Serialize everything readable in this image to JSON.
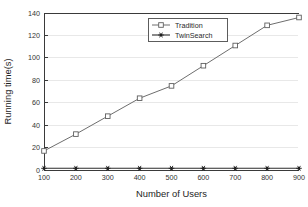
{
  "chart_data": {
    "type": "line",
    "title": "",
    "xlabel": "Number of Users",
    "ylabel": "Running time(s)",
    "x": [
      100,
      200,
      300,
      400,
      500,
      600,
      700,
      800,
      900
    ],
    "xticklabels": [
      "100",
      "200",
      "300",
      "400",
      "500",
      "600",
      "700",
      "800",
      "900"
    ],
    "yticklabels": [
      "0",
      "20",
      "40",
      "60",
      "80",
      "100",
      "120",
      "140"
    ],
    "yticks": [
      0,
      20,
      40,
      60,
      80,
      100,
      120,
      140
    ],
    "xlim": [
      100,
      900
    ],
    "ylim": [
      0,
      140
    ],
    "grid": "horizontal",
    "legend_position": "upper-center",
    "series": [
      {
        "name": "Tradition",
        "marker": "open-square",
        "color": "#6e6e6e",
        "values": [
          17,
          32,
          48,
          64,
          75,
          93,
          111,
          129,
          136
        ]
      },
      {
        "name": "TwinSearch",
        "marker": "filled-star",
        "color": "#2b2b2b",
        "values": [
          1.5,
          1.5,
          1.5,
          1.5,
          1.5,
          1.5,
          1.5,
          1.5,
          1.5
        ]
      }
    ]
  },
  "legend": {
    "entries": [
      {
        "label": "Tradition"
      },
      {
        "label": "TwinSearch"
      }
    ]
  },
  "axes": {
    "x_title": "Number of Users",
    "y_title": "Running time(s)"
  }
}
